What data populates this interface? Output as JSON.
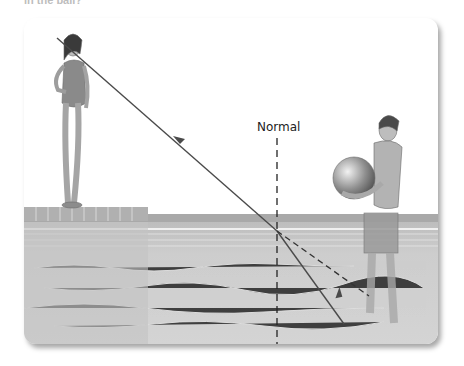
{
  "caption": "in the ball?",
  "figure": {
    "labels": {
      "normal": "Normal"
    },
    "scene": {
      "observer": "girl standing on pool deck",
      "object_holder": "boy standing in pool holding beach ball",
      "rays": [
        {
          "name": "actual-light-path",
          "style": "solid",
          "arrow": "toward observer"
        },
        {
          "name": "apparent-path",
          "style": "dashed"
        }
      ],
      "normal_line": {
        "style": "dashed",
        "orientation": "vertical"
      }
    },
    "colors": {
      "ray": "#4a4a4a",
      "water": "#c9c9c9",
      "deck": "#b5b5b5",
      "background": "#ffffff"
    }
  }
}
